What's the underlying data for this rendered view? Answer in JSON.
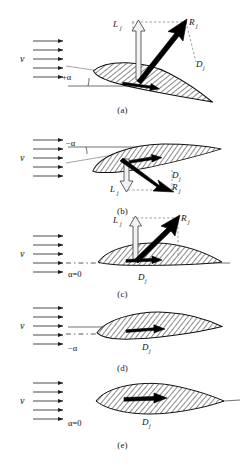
{
  "figure": {
    "symbols": {
      "velocity": "v",
      "lift": "L",
      "drag": "D",
      "resultant": "R",
      "subscript": "j"
    },
    "colors": {
      "ink": "#111111",
      "flow_arrow": "#2a2a2a",
      "dashed_guide": "#777777",
      "hollow_vector_fill": "#f2f2f2",
      "solid_vector": "#000000"
    }
  },
  "panels": [
    {
      "id": "a",
      "caption": "(a)",
      "velocity_label": "v",
      "angle_label": "+α",
      "angle_sign": "positive",
      "angle_deg": 12,
      "has_lift_vector": true,
      "has_drag_vector": true,
      "has_resultant_vector": true,
      "lift_label": "L",
      "lift_sub": "j",
      "drag_label": "D",
      "drag_sub": "j",
      "resultant_label": "R",
      "resultant_sub": "j",
      "lift_direction": "up",
      "resultant_direction": "up-right",
      "flow_arrow_count": 5,
      "airfoil_type": "cambered",
      "chord_line": "solid"
    },
    {
      "id": "b",
      "caption": "(b)",
      "velocity_label": "v",
      "angle_label": "−α",
      "angle_sign": "negative",
      "angle_deg": -10,
      "has_lift_vector": true,
      "has_drag_vector": true,
      "has_resultant_vector": true,
      "lift_label": "L",
      "lift_sub": "j",
      "drag_label": "D",
      "drag_sub": "j",
      "resultant_label": "R",
      "resultant_sub": "j",
      "lift_direction": "down",
      "resultant_direction": "down-right",
      "flow_arrow_count": 5,
      "airfoil_type": "cambered",
      "chord_line": "solid"
    },
    {
      "id": "c",
      "caption": "(c)",
      "velocity_label": "v",
      "angle_label": "α=0",
      "angle_sign": "zero",
      "angle_deg": 0,
      "has_lift_vector": true,
      "has_drag_vector": true,
      "has_resultant_vector": true,
      "lift_label": "L",
      "lift_sub": "j",
      "drag_label": "D",
      "drag_sub": "j",
      "resultant_label": "R",
      "resultant_sub": "j",
      "lift_direction": "up",
      "resultant_direction": "up-right",
      "flow_arrow_count": 5,
      "airfoil_type": "cambered",
      "chord_line": "dash-dot"
    },
    {
      "id": "d",
      "caption": "(d)",
      "velocity_label": "v",
      "angle_label": "−α",
      "angle_sign": "negative",
      "angle_deg": -4,
      "has_lift_vector": false,
      "has_drag_vector": true,
      "has_resultant_vector": false,
      "drag_label": "D",
      "drag_sub": "j",
      "flow_arrow_count": 5,
      "airfoil_type": "cambered",
      "chord_line": "dash-dot"
    },
    {
      "id": "e",
      "caption": "(e)",
      "velocity_label": "v",
      "angle_label": "α=0",
      "angle_sign": "zero",
      "angle_deg": 0,
      "has_lift_vector": false,
      "has_drag_vector": true,
      "has_resultant_vector": false,
      "drag_label": "D",
      "drag_sub": "j",
      "flow_arrow_count": 5,
      "airfoil_type": "symmetric",
      "chord_line": "none"
    }
  ]
}
